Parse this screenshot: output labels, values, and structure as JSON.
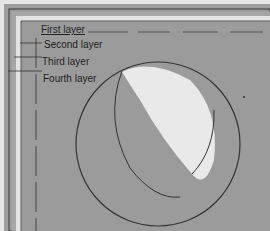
{
  "diagram": {
    "labels": {
      "first": "First layer",
      "second": "Second layer",
      "third": "Third layer",
      "fourth": "Fourth layer"
    },
    "colors": {
      "background": "#9a9a9a",
      "inner_fill": "#a3a3a3",
      "highlight": "#e9e9e9",
      "line": "#333333"
    }
  }
}
